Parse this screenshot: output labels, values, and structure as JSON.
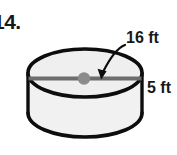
{
  "figure": {
    "problem_number": "14.",
    "shape": "cylinder",
    "fill_color": "#f0f0f0",
    "outline_color": "#0d0d0d",
    "background_color": "#ffffff",
    "center_dot_color": "#8a8a8a",
    "diameter_line_color": "#6e6e6e",
    "labels": {
      "diameter": "16 ft",
      "height": "5 ft"
    },
    "annotations": {
      "diameter_callout": "curved-arrow pointing to diameter line",
      "center_dot": "center of top circular face"
    }
  }
}
